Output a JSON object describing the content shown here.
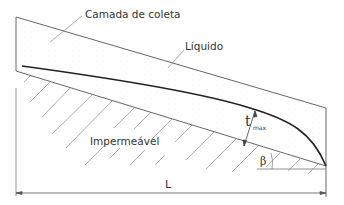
{
  "diagram": {
    "labels": {
      "collection_layer": "Camada de coleta",
      "liquid": "Líquido",
      "impermeable": "Impermeável",
      "length": "L",
      "thickness_symbol": "t",
      "thickness_subscript": "max",
      "angle": "β"
    },
    "colors": {
      "line": "#555555",
      "liquid_curve": "#222222",
      "hatch": "#9a9a9a",
      "leader": "#888888",
      "text": "#333333"
    }
  }
}
